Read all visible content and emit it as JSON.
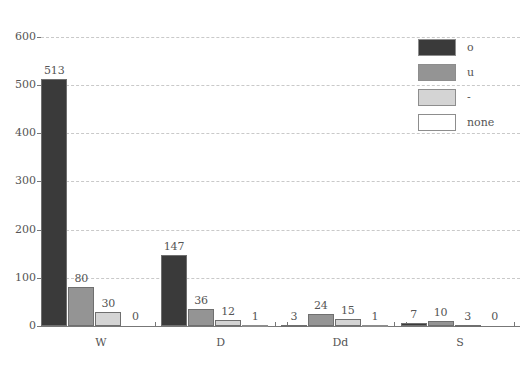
{
  "chart_data": {
    "type": "bar",
    "title": "",
    "subtitle": "",
    "xlabel": "",
    "ylabel": "",
    "categories": [
      "W",
      "D",
      "Dd",
      "S"
    ],
    "series": [
      {
        "name": "o",
        "color": "#3a3a3a",
        "values": [
          513,
          147,
          3,
          7
        ]
      },
      {
        "name": "u",
        "color": "#949494",
        "values": [
          80,
          36,
          24,
          10
        ]
      },
      {
        "name": "-",
        "color": "#d4d4d4",
        "values": [
          30,
          12,
          15,
          3
        ]
      },
      {
        "name": "none",
        "color": "#ffffff",
        "values": [
          0,
          1,
          1,
          0
        ]
      }
    ],
    "ylim": [
      0,
      620
    ],
    "yticks": [
      0,
      100,
      200,
      300,
      400,
      500,
      600
    ],
    "ytick_labels": [
      "0",
      "100",
      "200",
      "300",
      "400",
      "500",
      "600"
    ],
    "grid": true,
    "grid_axis": "y",
    "legend_position": "top-right",
    "bar_value_labels": true
  },
  "legend": {
    "items": [
      {
        "label": "o",
        "color": "#3a3a3a"
      },
      {
        "label": "u",
        "color": "#949494"
      },
      {
        "label": "-",
        "color": "#d4d4d4"
      },
      {
        "label": "none",
        "color": "#ffffff"
      }
    ]
  },
  "axes": {
    "y_tick_labels": [
      "600",
      "500",
      "400",
      "300",
      "200",
      "100",
      "0"
    ],
    "x_group_labels": [
      "W",
      "D",
      "Dd",
      "S"
    ]
  },
  "caption": {
    "text": ""
  }
}
